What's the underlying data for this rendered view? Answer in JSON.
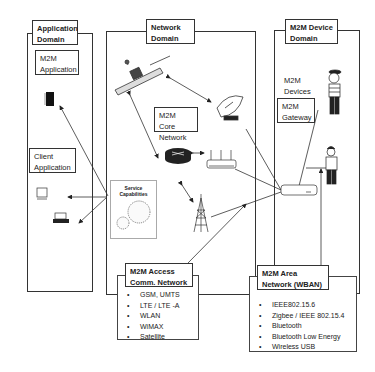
{
  "domains": {
    "application": {
      "title_line1": "Application",
      "title_line2": "Domain"
    },
    "network": {
      "title_line1": "Network",
      "title_line2": "Domain"
    },
    "device": {
      "title_line1": "M2M Device",
      "title_line2": "Domain"
    }
  },
  "labels": {
    "m2m_application": {
      "line1": "M2M",
      "line2": "Application"
    },
    "client_application": {
      "line1": "Client",
      "line2": "Application"
    },
    "m2m_core_network": {
      "line1": "M2M Core",
      "line2": "Network"
    },
    "m2m_devices": {
      "line1": "M2M",
      "line2": "Devices"
    },
    "m2m_gateway": {
      "line1": "M2M",
      "line2": "Gateway"
    },
    "service_capabilities": "Service Capabilities"
  },
  "access_network": {
    "title_line1": "M2M Access",
    "title_line2": "Comm. Network",
    "items": [
      "GSM, UMTS",
      "LTE / LTE -A",
      "WLAN",
      "WiMAX",
      "Satellite"
    ]
  },
  "area_network": {
    "title_line1": "M2M Area",
    "title_line2": "Network (WBAN)",
    "items": [
      "IEEE802.15.6",
      "Zigbee / IEEE 802.15.4",
      "Bluetooth",
      "Bluetooth Low Energy",
      "Wireless USB"
    ]
  },
  "icons": [
    "server-icon",
    "monitor-icon",
    "laptop-icon",
    "satellite-icon",
    "satellite-dish-icon",
    "router-icon",
    "wifi-router-icon",
    "cell-tower-icon",
    "gears-icon",
    "person-icon",
    "gateway-device-icon"
  ]
}
